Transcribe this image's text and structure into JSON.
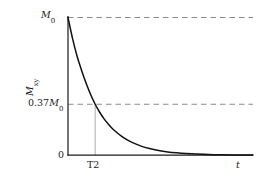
{
  "chart_data": {
    "type": "line",
    "title": "",
    "subtitle": "",
    "xlabel": "t",
    "ylabel": "Mxy",
    "ylabel_base": "M",
    "ylabel_sub": "xy",
    "xlabel_text": "t",
    "grid": false,
    "legend": null,
    "xlim": [
      0,
      1.0
    ],
    "ylim": [
      0,
      1.0
    ],
    "x_tick_labels": [
      "T2"
    ],
    "x_tick_values": [
      0.147
    ],
    "y_tick_labels": [
      "0",
      "0.37M0",
      "M0"
    ],
    "y_tick_values": [
      0,
      0.37,
      1.0
    ],
    "annotations": [
      {
        "name": "m0-dashed-level",
        "label_base": "M",
        "label_sub": "0",
        "value": 1.0
      },
      {
        "name": "decay-level",
        "label_prefix": "0.37",
        "label_base": "M",
        "label_sub": "0",
        "value": 0.37
      },
      {
        "name": "origin",
        "label": "0",
        "value": 0
      },
      {
        "name": "t2-tick",
        "label": "T2",
        "value": 0.147
      }
    ],
    "series": [
      {
        "name": "transverse magnetization decay",
        "equation": "Mxy = M0 * exp(-t/T2)",
        "color": "#111111",
        "x": [
          0.0,
          0.025,
          0.05,
          0.074,
          0.099,
          0.123,
          0.147,
          0.172,
          0.196,
          0.221,
          0.245,
          0.294,
          0.343,
          0.392,
          0.441,
          0.49,
          0.539,
          0.588,
          0.637,
          0.686,
          0.735,
          0.784,
          0.833,
          0.882,
          0.931,
          0.98,
          1.0
        ],
        "y": [
          1.0,
          0.845,
          0.715,
          0.614,
          0.519,
          0.439,
          0.37,
          0.31,
          0.262,
          0.221,
          0.187,
          0.133,
          0.095,
          0.068,
          0.048,
          0.034,
          0.024,
          0.017,
          0.012,
          0.009,
          0.006,
          0.004,
          0.003,
          0.002,
          0.002,
          0.001,
          0.001
        ]
      }
    ],
    "guides": [
      {
        "name": "m0-dashed-line",
        "orientation": "horizontal",
        "y": 1.0,
        "style": "dashed",
        "color": "#8a8a8a"
      },
      {
        "name": "decay-dashed-line",
        "orientation": "horizontal",
        "y": 0.37,
        "style": "dashed",
        "color": "#8a8a8a"
      },
      {
        "name": "t2-drop-line",
        "orientation": "vertical",
        "x": 0.147,
        "style": "solid",
        "color": "#b4b4b4"
      }
    ],
    "axes": {
      "axis_color": "#1a1a1a",
      "background": "#ffffff",
      "x_axis_name": "time-axis",
      "y_axis_name": "magnetization-axis"
    }
  },
  "labels": {
    "m0_base": "M",
    "m0_sub": "0",
    "decay_prefix": "0.37",
    "decay_base": "M",
    "decay_sub": "0",
    "origin": "0",
    "t2": "T2",
    "t": "t",
    "y_base": "M",
    "y_sub": "xy"
  }
}
